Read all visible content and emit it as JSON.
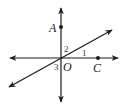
{
  "diagram": {
    "type": "geometry-intersecting-lines",
    "colors": {
      "line": "#1a1a1a",
      "background": "#ffffff"
    },
    "points": [
      {
        "id": "A",
        "label": "A",
        "x": 61,
        "y": 27
      },
      {
        "id": "O",
        "label": "O",
        "x": 61,
        "y": 58
      },
      {
        "id": "C",
        "label": "C",
        "x": 98,
        "y": 58
      }
    ],
    "lines": [
      {
        "id": "vertical",
        "through": [
          "A",
          "O"
        ],
        "arrows": "both"
      },
      {
        "id": "horizontal",
        "through": [
          "O",
          "C"
        ],
        "arrows": "both"
      },
      {
        "id": "diagonal",
        "through": [
          "O"
        ],
        "arrows": "both"
      }
    ],
    "angles": [
      {
        "id": "1",
        "label": "1"
      },
      {
        "id": "2",
        "label": "2"
      },
      {
        "id": "3",
        "label": "3"
      }
    ]
  }
}
